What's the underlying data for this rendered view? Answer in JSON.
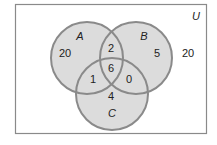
{
  "diagram": {
    "type": "venn",
    "universe_label": "U",
    "sets": [
      {
        "name": "A",
        "label": "A"
      },
      {
        "name": "B",
        "label": "B"
      },
      {
        "name": "C",
        "label": "C"
      }
    ],
    "regions": {
      "A_only": "20",
      "B_only": "5",
      "C_only": "4",
      "A_and_B_only": "2",
      "A_and_C_only": "1",
      "B_and_C_only": "0",
      "A_B_C": "6",
      "outside": "20"
    },
    "colors": {
      "circle_fill": "#dcdcdc",
      "circle_stroke": "#8a8a8a",
      "frame_stroke": "#8a8a8a",
      "text": "#222222"
    }
  }
}
